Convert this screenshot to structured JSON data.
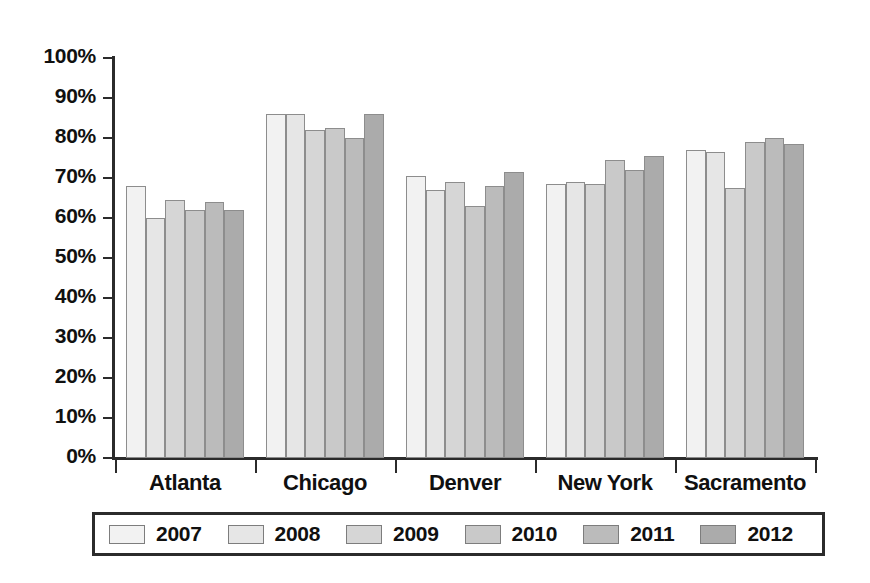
{
  "chart_data": {
    "type": "bar",
    "title": "",
    "subtitle": "",
    "xlabel": "",
    "ylabel": "",
    "categories": [
      "Atlanta",
      "Chicago",
      "Denver",
      "New York",
      "Sacramento"
    ],
    "ylim": [
      0,
      100
    ],
    "y_tick_labels": [
      "100%",
      "90%",
      "80%",
      "70%",
      "60%",
      "50%",
      "40%",
      "30%",
      "20%",
      "10%",
      "0%"
    ],
    "y_tick_values": [
      100,
      90,
      80,
      70,
      60,
      50,
      40,
      30,
      20,
      10,
      0
    ],
    "y_tick_step": 10,
    "value_unit": "%",
    "grid": false,
    "legend_position": "bottom",
    "series": [
      {
        "name": "2007",
        "color": "#f2f2f2",
        "values": [
          68,
          86,
          70.5,
          68.5,
          77
        ]
      },
      {
        "name": "2008",
        "color": "#e6e6e6",
        "values": [
          60,
          86,
          67,
          69,
          76.5
        ]
      },
      {
        "name": "2009",
        "color": "#d6d6d6",
        "values": [
          64.5,
          82,
          69,
          68.5,
          67.5
        ]
      },
      {
        "name": "2010",
        "color": "#c9c9c9",
        "values": [
          62,
          82.5,
          63,
          74.5,
          79
        ]
      },
      {
        "name": "2011",
        "color": "#bbbbbb",
        "values": [
          64,
          80,
          68,
          72,
          80
        ]
      },
      {
        "name": "2012",
        "color": "#ababab",
        "values": [
          62,
          86,
          71.5,
          75.5,
          78.5
        ]
      }
    ]
  },
  "legend": {
    "items": [
      {
        "label": "2007"
      },
      {
        "label": "2008"
      },
      {
        "label": "2009"
      },
      {
        "label": "2010"
      },
      {
        "label": "2011"
      },
      {
        "label": "2012"
      }
    ]
  },
  "axis": {
    "bar_border_color": "#8d8d8d",
    "axis_color": "#2b2b2b"
  }
}
